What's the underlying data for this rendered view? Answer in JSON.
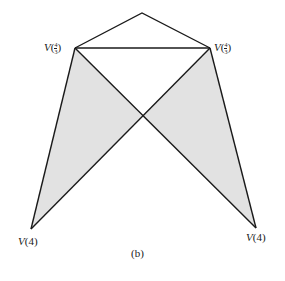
{
  "diagram": {
    "caption": "(b)",
    "labels": {
      "upper_left": {
        "var": "V",
        "num": "4",
        "den": "3"
      },
      "upper_right": {
        "var": "V",
        "num": "4",
        "den": "3"
      },
      "bottom_left": {
        "var": "V",
        "arg": "(4)"
      },
      "bottom_right": {
        "var": "V",
        "arg": "(4)"
      }
    },
    "vertices": {
      "top": [
        142,
        13
      ],
      "upper_left": [
        75,
        48
      ],
      "upper_right": [
        210,
        48
      ],
      "crossing": [
        142,
        116
      ],
      "bottom_left": [
        31,
        229
      ],
      "bottom_right": [
        256,
        228
      ]
    },
    "colors": {
      "line": "#1a1a1a",
      "shade": "#e2e2e2"
    }
  }
}
